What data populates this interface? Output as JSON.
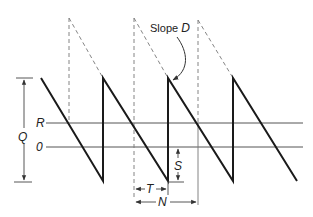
{
  "diagram": {
    "type": "sawtooth inventory diagram",
    "labels": {
      "slope_prefix": "Slope ",
      "slope_var": "D",
      "Q": "Q",
      "R": "R",
      "zero": "0",
      "S": "S",
      "T": "T",
      "N": "N"
    },
    "colors": {
      "stroke": "#1a1a1a",
      "thin": "#555555",
      "dashed": "#777777",
      "background": "#ffffff"
    }
  }
}
